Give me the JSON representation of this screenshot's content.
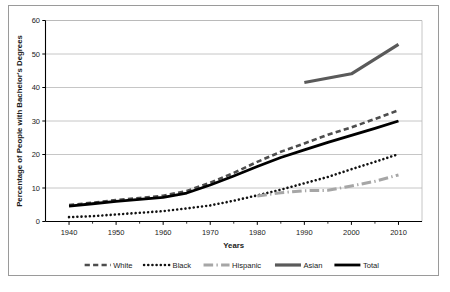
{
  "chart_data": {
    "type": "line",
    "title": "",
    "xlabel": "Years",
    "ylabel": "Percentage of People with Bachelor's Degrees",
    "xlim": [
      1935,
      2015
    ],
    "ylim": [
      0,
      60
    ],
    "xticks": [
      1940,
      1950,
      1960,
      1970,
      1980,
      1990,
      2000,
      2010
    ],
    "yticks": [
      0,
      10,
      20,
      30,
      40,
      50,
      60
    ],
    "xtick_labels": [
      "1940",
      "1950",
      "1960",
      "1970",
      "1980",
      "1990",
      "2000",
      "2010"
    ],
    "ytick_labels": [
      "0",
      "10",
      "20",
      "30",
      "40",
      "50",
      "60"
    ],
    "grid": "horizontal",
    "legend_position": "bottom",
    "series": [
      {
        "name": "White",
        "color": "#4d4d4d",
        "style": "dashed",
        "width": 2.6,
        "x": [
          1940,
          1945,
          1950,
          1955,
          1960,
          1965,
          1970,
          1975,
          1980,
          1985,
          1990,
          1995,
          2000,
          2005,
          2010
        ],
        "values": [
          4.9,
          5.6,
          6.4,
          7.0,
          7.7,
          9.1,
          11.6,
          14.5,
          17.8,
          20.8,
          23.3,
          25.9,
          28.1,
          30.6,
          33.2
        ]
      },
      {
        "name": "Black",
        "color": "#111111",
        "style": "dotted",
        "width": 2.6,
        "x": [
          1940,
          1945,
          1950,
          1955,
          1960,
          1965,
          1970,
          1975,
          1980,
          1985,
          1990,
          1995,
          2000,
          2005,
          2010
        ],
        "values": [
          1.3,
          1.6,
          2.1,
          2.6,
          3.1,
          3.9,
          4.8,
          6.2,
          7.8,
          9.5,
          11.4,
          13.3,
          15.6,
          17.8,
          20.1
        ]
      },
      {
        "name": "Hispanic",
        "color": "#a6a6a6",
        "style": "dashdot",
        "width": 3.0,
        "x": [
          1980,
          1985,
          1990,
          1995,
          2000,
          2005,
          2010
        ],
        "values": [
          7.6,
          8.6,
          9.2,
          9.3,
          10.6,
          12.0,
          13.9
        ]
      },
      {
        "name": "Asian",
        "color": "#5a5a5a",
        "style": "solid",
        "width": 3.2,
        "x": [
          1990,
          2000,
          2010
        ],
        "values": [
          41.5,
          44.1,
          52.9
        ]
      },
      {
        "name": "Total",
        "color": "#000000",
        "style": "solid",
        "width": 2.8,
        "x": [
          1940,
          1945,
          1950,
          1955,
          1960,
          1965,
          1970,
          1975,
          1980,
          1985,
          1990,
          1995,
          2000,
          2005,
          2010
        ],
        "values": [
          4.6,
          5.3,
          6.0,
          6.6,
          7.2,
          8.5,
          10.9,
          13.6,
          16.4,
          19.1,
          21.4,
          23.6,
          25.7,
          27.8,
          30.0
        ]
      }
    ]
  },
  "legend": {
    "items": [
      {
        "label": "White"
      },
      {
        "label": "Black"
      },
      {
        "label": "Hispanic"
      },
      {
        "label": "Asian"
      },
      {
        "label": "Total"
      }
    ]
  },
  "colors": {
    "frame_border": "#9a9a9a",
    "axis": "#000000",
    "grid": "#b7b7b7",
    "background": "#ffffff"
  }
}
